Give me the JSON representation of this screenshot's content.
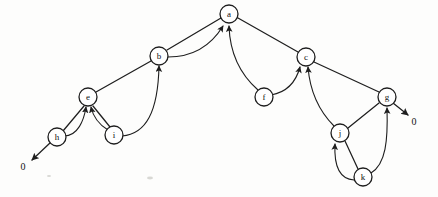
{
  "figure": {
    "background_color": "#fdfdfc",
    "stroke_color": "#1e1e1e",
    "node_fill": "#ffffff",
    "node_radius": 9
  },
  "nodes": [
    {
      "id": "a",
      "label": "a",
      "x": 229,
      "y": 14
    },
    {
      "id": "b",
      "label": "b",
      "x": 159,
      "y": 56
    },
    {
      "id": "c",
      "label": "c",
      "x": 306,
      "y": 57
    },
    {
      "id": "e",
      "label": "e",
      "x": 88,
      "y": 97
    },
    {
      "id": "f",
      "label": "f",
      "x": 264,
      "y": 97
    },
    {
      "id": "g",
      "label": "g",
      "x": 387,
      "y": 97
    },
    {
      "id": "h",
      "label": "h",
      "x": 57,
      "y": 137
    },
    {
      "id": "i",
      "label": "i",
      "x": 114,
      "y": 135
    },
    {
      "id": "j",
      "label": "j",
      "x": 340,
      "y": 133
    },
    {
      "id": "k",
      "label": "k",
      "x": 363,
      "y": 177
    }
  ],
  "null_labels": [
    {
      "id": "null-left",
      "label": "0",
      "x": 23,
      "y": 168
    },
    {
      "id": "null-right",
      "label": "0",
      "x": 414,
      "y": 123
    }
  ],
  "edges": [
    {
      "id": "edge-b-a",
      "from": "b",
      "to": "a",
      "kind": "line",
      "arrow": false,
      "d": "M 167 50 L 221 18"
    },
    {
      "id": "edge-a-c",
      "from": "a",
      "to": "c",
      "kind": "line",
      "arrow": false,
      "d": "M 238 18 L 298 52"
    },
    {
      "id": "edge-e-b",
      "from": "e",
      "to": "b",
      "kind": "line",
      "arrow": false,
      "d": "M 96 92 L 151 61"
    },
    {
      "id": "edge-c-g",
      "from": "c",
      "to": "g",
      "kind": "line",
      "arrow": false,
      "d": "M 314 62 L 379 92"
    },
    {
      "id": "edge-h-e",
      "from": "h",
      "to": "e",
      "kind": "line",
      "arrow": false,
      "d": "M 63 131 L 84 106"
    },
    {
      "id": "edge-e-i",
      "from": "e",
      "to": "i",
      "kind": "line",
      "arrow": false,
      "d": "M 93 106 L 110 127"
    },
    {
      "id": "edge-g-j",
      "from": "g",
      "to": "j",
      "kind": "line",
      "arrow": false,
      "d": "M 379 103 L 348 128"
    },
    {
      "id": "edge-j-k",
      "from": "j",
      "to": "k",
      "kind": "line",
      "arrow": false,
      "d": "M 345 141 L 358 169"
    },
    {
      "id": "edge-b-a-curve",
      "from": "b",
      "to": "a",
      "kind": "curve",
      "arrow": true,
      "d": "M 168 57 C 196 57 212 44 223 26"
    },
    {
      "id": "edge-f-a-curve",
      "from": "f",
      "to": "a",
      "kind": "curve",
      "arrow": true,
      "d": "M 258 90 C 242 76 230 56 229 26"
    },
    {
      "id": "edge-h-e-curve",
      "from": "h",
      "to": "e",
      "kind": "curve",
      "arrow": true,
      "d": "M 64 136 C 78 136 84 120 86 107"
    },
    {
      "id": "edge-i-e-curve",
      "from": "i",
      "to": "e",
      "kind": "curve",
      "arrow": true,
      "d": "M 108 130 C 98 124 93 116 91 107"
    },
    {
      "id": "edge-i-b-curve",
      "from": "i",
      "to": "b",
      "kind": "curve",
      "arrow": true,
      "d": "M 122 136 C 146 134 158 112 159 66"
    },
    {
      "id": "edge-f-c-curve",
      "from": "f",
      "to": "c",
      "kind": "curve",
      "arrow": true,
      "d": "M 271 95 C 288 92 296 82 300 67"
    },
    {
      "id": "edge-j-c-curve",
      "from": "j",
      "to": "c",
      "kind": "curve",
      "arrow": true,
      "d": "M 334 126 C 320 112 310 92 308 67"
    },
    {
      "id": "edge-k-j-curve",
      "from": "k",
      "to": "j",
      "kind": "curve",
      "arrow": true,
      "d": "M 354 180 C 338 179 334 164 335 144"
    },
    {
      "id": "edge-k-g-curve",
      "from": "k",
      "to": "g",
      "kind": "curve",
      "arrow": true,
      "d": "M 371 173 C 386 164 388 140 387 108"
    },
    {
      "id": "edge-h-null",
      "from": "h",
      "to": "null-left",
      "kind": "line",
      "arrow": true,
      "d": "M 51 142 L 32 160"
    },
    {
      "id": "edge-g-null",
      "from": "g",
      "to": "null-right",
      "kind": "line",
      "arrow": true,
      "d": "M 393 103 L 408 115"
    }
  ]
}
